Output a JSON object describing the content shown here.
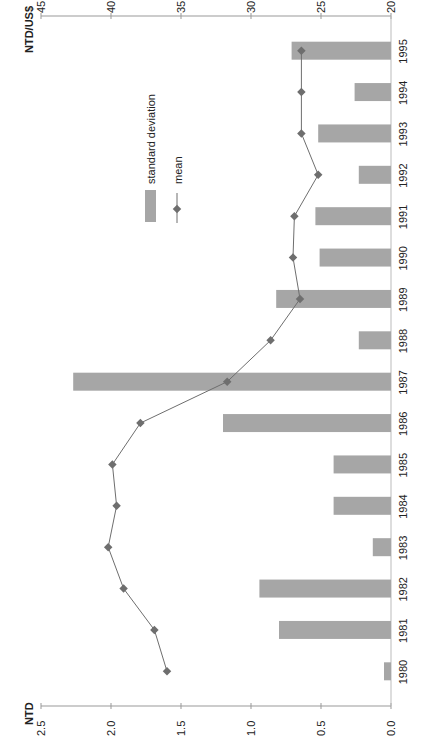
{
  "chart_data": {
    "type": "bar",
    "orientation": "rotated-90-ccw",
    "title": "",
    "categories": [
      "1980",
      "1981",
      "1982",
      "1983",
      "1984",
      "1985",
      "1986",
      "1987",
      "1988",
      "1989",
      "1990",
      "1991",
      "1992",
      "1993",
      "1994",
      "1995"
    ],
    "series": [
      {
        "name": "standard deviation",
        "type": "bar",
        "axis": "left",
        "unit": "NTD",
        "color": "#a6a6a6",
        "values": [
          0.05,
          0.8,
          0.94,
          0.13,
          0.41,
          0.41,
          1.2,
          2.27,
          0.23,
          0.82,
          0.51,
          0.54,
          0.23,
          0.52,
          0.26,
          0.71
        ]
      },
      {
        "name": "mean",
        "type": "line",
        "marker": "diamond",
        "axis": "right",
        "unit": "NTD/US$",
        "color": "#6e6e6e",
        "values": [
          36.0,
          36.9,
          39.1,
          40.2,
          39.6,
          39.9,
          37.9,
          31.7,
          28.6,
          26.5,
          27.0,
          26.9,
          25.2,
          26.4,
          26.4,
          26.4
        ]
      }
    ],
    "left_axis": {
      "label": "NTD",
      "ylim": [
        0.0,
        2.5
      ],
      "ticks": [
        "0.0",
        "0.5",
        "1.0",
        "1.5",
        "2.0",
        "2.5"
      ]
    },
    "right_axis": {
      "label": "NTD/US$",
      "ylim": [
        20,
        45
      ],
      "ticks": [
        "20",
        "25",
        "30",
        "35",
        "40",
        "45"
      ]
    },
    "legend": {
      "position": "upper-center",
      "entries": [
        "standard deviation",
        "mean"
      ]
    },
    "grid": false
  },
  "labels": {
    "left_axis_title": "NTD",
    "right_axis_title": "NTD/US$",
    "legend_sd": "standard deviation",
    "legend_mean": "mean"
  }
}
